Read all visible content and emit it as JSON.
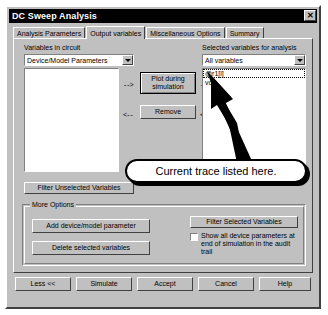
{
  "window": {
    "title": "DC Sweep Analysis",
    "close_label": "✕",
    "close_icon": "close-icon"
  },
  "tabs": [
    {
      "label": "Analysis Parameters",
      "active": false
    },
    {
      "label": "Output variables",
      "active": true
    },
    {
      "label": "Miscellaneous Options",
      "active": false
    },
    {
      "label": "Summary",
      "active": false
    }
  ],
  "left_panel": {
    "label": "Variables in circuit",
    "filter_combo": {
      "value": "Device/Model Parameters",
      "arrow_icon": "chevron-down-icon"
    },
    "list_items": [],
    "filter_button": "Filter Unselected Variables"
  },
  "right_panel": {
    "label": "Selected variables for analysis",
    "filter_combo": {
      "value": "All variables",
      "arrow_icon": "chevron-down-icon"
    },
    "list_items": [
      {
        "text": "@r1[i]",
        "selected": true
      },
      {
        "text": "vo",
        "selected": false
      }
    ]
  },
  "transfer": {
    "add_button": "Plot during simulation",
    "remove_button": "Remove",
    "add_arrow_left": "-->",
    "add_arrow_right": "-->",
    "remove_arrow_left": "<--",
    "remove_arrow_right": "<--"
  },
  "more_options": {
    "title": "More Options",
    "add_param_button": "Add device/model parameter",
    "delete_vars_button": "Delete selected variables",
    "filter_selected_button": "Filter Selected Variables",
    "checkbox": {
      "label": "Show all device parameters at end of simulation in the audit trail",
      "checked": false
    }
  },
  "footer": {
    "buttons": [
      "Less <<",
      "Simulate",
      "Accept",
      "Cancel",
      "Help"
    ]
  },
  "annotation": {
    "callout_text": "Current trace listed here.",
    "points_to": "@r1[i]"
  },
  "colors": {
    "face": "#c0c0c0",
    "titlebar": "#000000",
    "titlebar_text": "#ffffff",
    "field": "#ffffff",
    "shadow": "#404040",
    "annotation": "#000000"
  }
}
